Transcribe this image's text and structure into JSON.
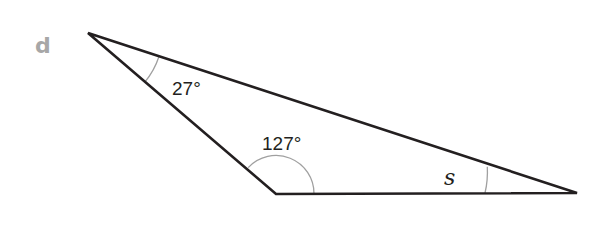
{
  "problem": {
    "label": "d"
  },
  "triangle": {
    "vertices": {
      "top_left": [
        88,
        33
      ],
      "bottom_left": [
        276,
        194
      ],
      "right": [
        577,
        193
      ]
    },
    "angles": [
      {
        "vertex": "top_left",
        "label": "27°"
      },
      {
        "vertex": "bottom_left",
        "label": "127°"
      },
      {
        "vertex": "right",
        "label": "s"
      }
    ]
  },
  "colors": {
    "stroke": "#231f20",
    "arc": "#a0a0a0",
    "label_letter": "#a7a7a7"
  }
}
